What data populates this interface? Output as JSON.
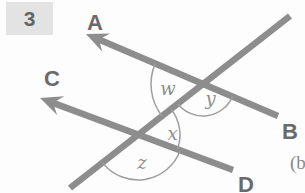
{
  "problem": {
    "number": "3"
  },
  "subfigure_label": "(b",
  "figure": {
    "labels": {
      "rayA": "A",
      "rayB": "B",
      "rayC": "C",
      "rayD": "D",
      "angleW": "w",
      "angleX": "x",
      "angleY": "y",
      "angleZ": "z"
    }
  },
  "colors": {
    "background": "#fdfdfd",
    "diagram_line": "#8d8d8d",
    "angle_arc": "#9e9e9e",
    "ray_label": "#6a6a6a",
    "angle_label": "#8e8e8e",
    "problem_badge_bg": "#e3e3e3",
    "problem_number_text": "#666666",
    "subfigure_label_text": "#8a8a8a"
  }
}
